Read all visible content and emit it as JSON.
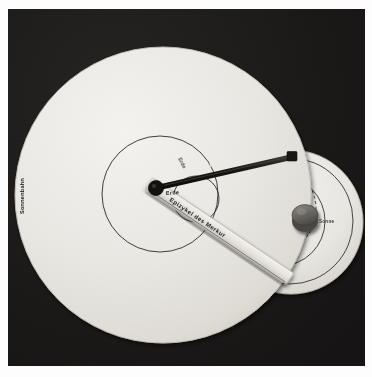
{
  "photo": {
    "title": "Ptolemaeisches Epizykelmodell — Merkur",
    "description": "Photograph of a mechanical Ptolemaic model demonstrating the epicycle of Mercury relative to the Earth and the Sun's path.",
    "background_color": "#1d1b1a",
    "frame_color": "#fdfdfd",
    "disc_color": "#eceae6"
  },
  "labels": {
    "sun_path": "Sonnenbahn",
    "earth": "Erde",
    "mercury": "Merkur",
    "mercury_epicycle": "Epizykel des Merkur",
    "sun": "Sonne",
    "inner_small": "Erde"
  },
  "parts": {
    "main_disc_name": "Sonnenbahn-Scheibe",
    "secondary_disc_name": "Epizykel-Scheibe",
    "pointer_rod_name": "Merkur-Zeigerstab",
    "ruler_arm_name": "Epizykel-Lineal",
    "knob_name": "Sonne-Drehknopf",
    "earth_pivot_name": "Erde-Drehpunkt",
    "mercury_marker_name": "Merkur-Marke"
  },
  "colors": {
    "disc_light": "#eceae6",
    "disc_shadow": "#c9c6c0",
    "line_dark": "#272423",
    "rod_dark": "#1a1817",
    "knob_grey": "#6f6c68",
    "backdrop": "#1d1b1a"
  },
  "geometry": {
    "main_disc_center_x": 155,
    "main_disc_center_y": 186,
    "main_disc_radius": 148,
    "secondary_disc_center_x": 283,
    "secondary_disc_center_y": 213,
    "secondary_disc_radius": 72,
    "earth_dot_x": 148,
    "earth_dot_y": 179,
    "mercury_marker_x": 284,
    "mercury_marker_y": 148,
    "knob_x": 297,
    "knob_y": 208,
    "knob_radius": 13
  }
}
